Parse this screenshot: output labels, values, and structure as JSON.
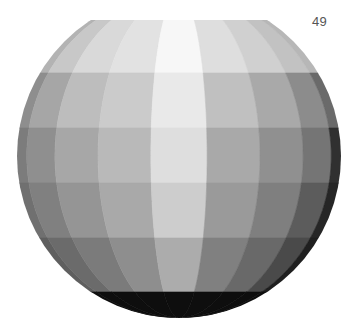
{
  "page": {
    "number": "49"
  },
  "figure": {
    "geometry": {
      "cx": 179,
      "cy": 156,
      "r": 162,
      "top_cut_y": 20
    },
    "band_edges_y": [
      20,
      73,
      128,
      183,
      238,
      292,
      320
    ],
    "gore_count": 9,
    "shades": [
      [
        "#b3b3b3",
        "#c8c8c8",
        "#d9d9d9",
        "#e2e2e2",
        "#f7f7f7",
        "#dedede",
        "#d0d0d0",
        "#c2c2c2",
        "#b7b7b7"
      ],
      [
        "#8e8e8e",
        "#a6a6a6",
        "#bdbdbd",
        "#cbcbcb",
        "#e9e9e9",
        "#c0c0c0",
        "#a9a9a9",
        "#8c8c8c",
        "#6a6a6a"
      ],
      [
        "#7c7c7c",
        "#8f8f8f",
        "#a7a7a7",
        "#b9b9b9",
        "#dedede",
        "#a9a9a9",
        "#909090",
        "#757575",
        "#303030"
      ],
      [
        "#707070",
        "#808080",
        "#959595",
        "#a9a9a9",
        "#cdcdcd",
        "#9a9a9a",
        "#7f7f7f",
        "#5c5c5c",
        "#262626"
      ],
      [
        "#5f5f5f",
        "#6b6b6b",
        "#7b7b7b",
        "#8e8e8e",
        "#acacac",
        "#808080",
        "#696969",
        "#4a4a4a",
        "#1f1f1f"
      ],
      [
        "#0e0e0e",
        "#0e0e0e",
        "#0e0e0e",
        "#0e0e0e",
        "#0e0e0e",
        "#0e0e0e",
        "#0e0e0e",
        "#0e0e0e",
        "#0e0e0e"
      ]
    ]
  }
}
